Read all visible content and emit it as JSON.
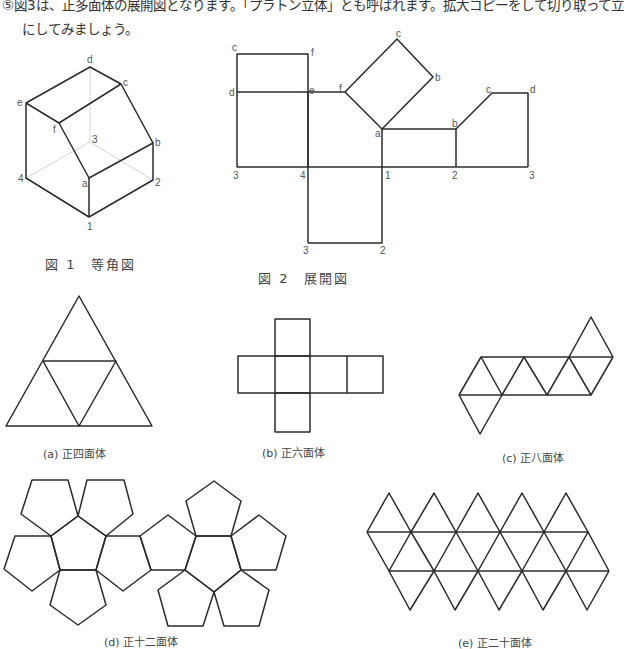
{
  "intro": {
    "line1": "⑤図3は、正多面体の展開図となります。「プラトン立体」とも呼ばれます。拡大コピーをして切り取って立",
    "line2": "にしてみましょう。"
  },
  "figure1": {
    "caption": "図 1　等角図",
    "labels": {
      "d": "d",
      "c": "c",
      "e": "e",
      "f": "f",
      "b": "b",
      "v3": "3",
      "v4": "4",
      "a": "a",
      "v2": "2",
      "v1": "1"
    }
  },
  "figure2": {
    "caption": "図 2　展開図",
    "labels": {
      "c1": "c",
      "f1": "f",
      "d1": "d",
      "e1": "e",
      "f2": "f",
      "a1": "a",
      "c2": "c",
      "b1": "b",
      "b2": "b",
      "c3": "c",
      "d2": "d",
      "n3a": "3",
      "n4": "4",
      "n1": "1",
      "n2a": "2",
      "n3b": "3",
      "n3c": "3",
      "n2b": "2"
    }
  },
  "solids": [
    {
      "id": "a",
      "caption": "(a) 正四面体"
    },
    {
      "id": "b",
      "caption": "(b) 正六面体"
    },
    {
      "id": "c",
      "caption": "(c) 正八面体"
    },
    {
      "id": "d",
      "caption": "(d) 正十二面体"
    },
    {
      "id": "e",
      "caption": "(e) 正二十面体"
    }
  ]
}
